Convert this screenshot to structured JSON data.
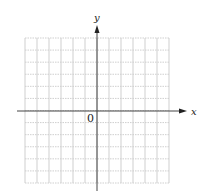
{
  "figure": {
    "type": "coordinate-grid",
    "x_axis_label": "x",
    "y_axis_label": "y",
    "origin_label": "0",
    "grid": {
      "columns": 12,
      "rows": 12,
      "x_range": [
        -6,
        6
      ],
      "y_range": [
        -6,
        6
      ],
      "line_color": "#cfcfcf",
      "horizontal_style": "dotted",
      "vertical_style": "solid"
    },
    "axis_color": "#333333"
  }
}
